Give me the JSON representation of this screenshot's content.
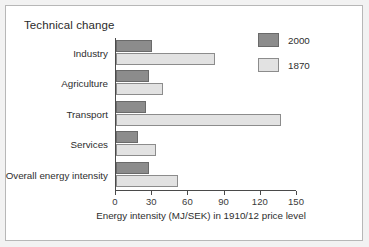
{
  "chart_data": {
    "type": "bar",
    "orientation": "horizontal",
    "title": "Technical change",
    "xlabel": "Energy intensity (MJ/SEK) in 1910/12 price level",
    "ylabel": "",
    "categories": [
      "Industry",
      "Agriculture",
      "Transport",
      "Services",
      "Overall energy intensity"
    ],
    "series": [
      {
        "name": "2000",
        "color": "#8c8c8c",
        "values": [
          30,
          27,
          25,
          18,
          27
        ]
      },
      {
        "name": "1870",
        "color": "#e2e2e2",
        "values": [
          82,
          39,
          137,
          33,
          51
        ]
      }
    ],
    "xlim": [
      0,
      150
    ],
    "xticks": [
      0,
      30,
      60,
      90,
      120,
      150
    ],
    "xtick_labels": [
      "0",
      "30",
      "60",
      "90",
      "120",
      "150"
    ],
    "grid": false,
    "legend_position": "top-right",
    "legend_entries": [
      "2000",
      "1870"
    ]
  },
  "figure": {
    "background_color": "#f2f2f2",
    "plot_background_color": "#ffffff",
    "border_color": "#b7b7b7",
    "axis_color": "#4a4a4a",
    "text_color": "#2e2e2e"
  }
}
